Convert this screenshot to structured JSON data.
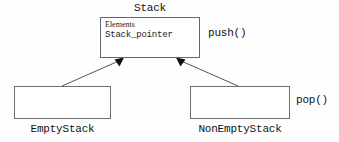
{
  "diagram": {
    "type": "uml-class-inheritance",
    "background_color": "#fefefe",
    "line_color": "#555555",
    "box_border_color": "#6f6f6f",
    "text_color": "#111111",
    "superclass": {
      "title": "Stack",
      "attributes": [
        {
          "name": "Elements"
        },
        {
          "name": "Stack_pointer"
        }
      ],
      "operation_label": "push()"
    },
    "subclasses": [
      {
        "label": "EmptyStack",
        "operation_label": ""
      },
      {
        "label": "NonEmptyStack",
        "operation_label": "pop()"
      }
    ],
    "relationships": [
      {
        "kind": "generalization",
        "from": "EmptyStack",
        "to": "Stack",
        "arrowhead": "filled-triangle"
      },
      {
        "kind": "generalization",
        "from": "NonEmptyStack",
        "to": "Stack",
        "arrowhead": "filled-triangle"
      }
    ]
  }
}
